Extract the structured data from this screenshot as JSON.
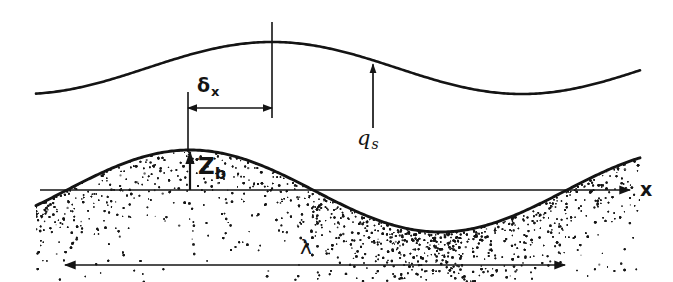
{
  "figure": {
    "background_color": "#ffffff",
    "ink_color": "#141414",
    "width": 673,
    "height": 282
  },
  "labels": {
    "delta_x": {
      "symbol": "δ",
      "subscript": "x"
    },
    "z_b": {
      "symbol": "Z",
      "subscript": "b"
    },
    "q_s": {
      "symbol": "q",
      "subscript": "s"
    },
    "wavelength": {
      "symbol": "λ"
    },
    "axis_x": {
      "symbol": "x"
    }
  },
  "chart_data": {
    "type": "line",
    "title": "",
    "xlabel": "x",
    "ylabel": "",
    "grid": false,
    "legend_position": "none",
    "annotations": [
      {
        "name": "delta-x-dimension",
        "text": "δx",
        "meaning": "phase lag between bed crest and water surface crest",
        "x_start": 188,
        "x_end": 272,
        "y": 108
      },
      {
        "name": "z-b-dimension",
        "text": "Zb",
        "meaning": "bed elevation above datum at crest",
        "x": 190,
        "y_start": 190,
        "y_end": 152
      },
      {
        "name": "q-s-arrow",
        "text": "qs",
        "meaning": "sediment transport rate at water surface station",
        "x": 373,
        "y_start": 128,
        "y_end": 70
      },
      {
        "name": "wavelength-dimension",
        "text": "λ",
        "meaning": "bedform wavelength",
        "x_start": 65,
        "x_end": 565,
        "y": 265
      },
      {
        "name": "x-axis-arrow",
        "text": "x",
        "meaning": "streamwise coordinate direction",
        "x_start": 40,
        "x_end": 630,
        "y": 190
      }
    ],
    "series": [
      {
        "name": "water-surface",
        "description": "free surface profile, crest upstream-shifted relative to bed crest",
        "amplitude": 26,
        "wavelength": 500,
        "crest_x": 272,
        "crest_y": 42,
        "trough_x": 522,
        "trough_y": 94,
        "mean_y": 68,
        "x_start": 36,
        "x_end": 640
      },
      {
        "name": "bed-surface",
        "description": "sand bedform profile over datum line",
        "amplitude": 41,
        "wavelength": 500,
        "crest_x": 190,
        "crest_y": 150,
        "trough_x": 440,
        "trough_y": 232,
        "mean_y": 191,
        "x_start": 36,
        "x_end": 640,
        "datum_y": 190,
        "fill": "stipple"
      }
    ]
  }
}
